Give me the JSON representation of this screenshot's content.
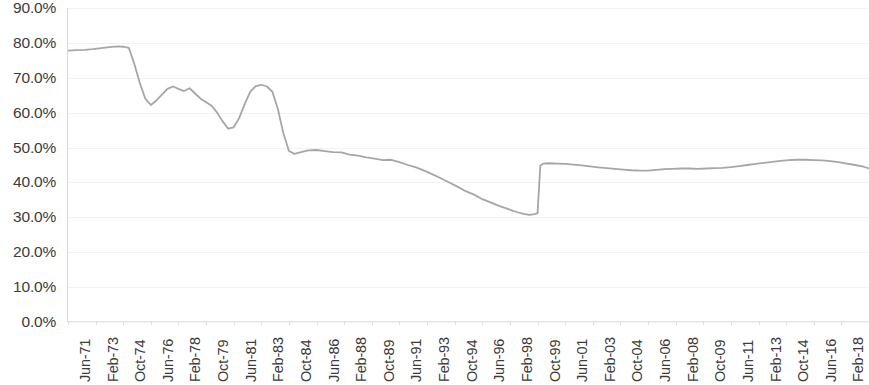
{
  "chart_data": {
    "type": "line",
    "title": "",
    "subtitle": "",
    "xlabel": "",
    "ylabel": "",
    "ylim": [
      0,
      90
    ],
    "ytick_labels": [
      "90.0%",
      "80.0%",
      "70.0%",
      "60.0%",
      "50.0%",
      "40.0%",
      "30.0%",
      "20.0%",
      "10.0%",
      "0.0%"
    ],
    "ytick_values": [
      90,
      80,
      70,
      60,
      50,
      40,
      30,
      20,
      10,
      0
    ],
    "grid": true,
    "legend": "none",
    "line_color": "#a6a6a6",
    "line_width": 1.8,
    "markers": false,
    "xtick_labels": [
      "Jun-71",
      "Feb-73",
      "Oct-74",
      "Jun-76",
      "Feb-78",
      "Oct-79",
      "Jun-81",
      "Feb-83",
      "Oct-84",
      "Jun-86",
      "Feb-88",
      "Oct-89",
      "Jun-91",
      "Feb-93",
      "Oct-94",
      "Jun-96",
      "Feb-98",
      "Oct-99",
      "Jun-01",
      "Feb-03",
      "Oct-04",
      "Jun-06",
      "Feb-08",
      "Oct-09",
      "Jun-11",
      "Feb-13",
      "Oct-14",
      "Jun-16",
      "Feb-18"
    ],
    "xtick_interval_months": 20,
    "x_start": "Jun-71",
    "x_end": "Oct-19",
    "series": [
      {
        "name": "Series 1",
        "x": [
          "Jun-71",
          "Dec-71",
          "Jun-72",
          "Dec-72",
          "Jun-73",
          "Dec-73",
          "Jun-74",
          "Oct-74",
          "Feb-75",
          "Jun-75",
          "Oct-75",
          "Feb-76",
          "Jun-76",
          "Oct-76",
          "Feb-77",
          "Jun-77",
          "Oct-77",
          "Feb-78",
          "Jun-78",
          "Oct-78",
          "Feb-79",
          "Jun-79",
          "Oct-79",
          "Feb-80",
          "Jun-80",
          "Oct-80",
          "Feb-81",
          "Jun-81",
          "Oct-81",
          "Feb-82",
          "Jun-82",
          "Oct-82",
          "Feb-83",
          "Jun-83",
          "Oct-83",
          "Feb-84",
          "Jun-84",
          "Oct-84",
          "Feb-85",
          "Jun-85",
          "Dec-85",
          "Jun-86",
          "Dec-86",
          "Jun-87",
          "Dec-87",
          "Jun-88",
          "Dec-88",
          "Jun-89",
          "Dec-89",
          "Jun-90",
          "Dec-90",
          "Jun-91",
          "Dec-91",
          "Jun-92",
          "Dec-92",
          "Jun-93",
          "Dec-93",
          "Jun-94",
          "Dec-94",
          "Jun-95",
          "Dec-95",
          "Jun-96",
          "Dec-96",
          "Jun-97",
          "Dec-97",
          "Jun-98",
          "Dec-98",
          "Apr-99",
          "Aug-99",
          "Oct-99",
          "Nov-99",
          "Dec-99",
          "Feb-00",
          "Jun-00",
          "Dec-00",
          "Jun-01",
          "Dec-01",
          "Jun-02",
          "Dec-02",
          "Jun-03",
          "Dec-03",
          "Jun-04",
          "Dec-04",
          "Jun-05",
          "Dec-05",
          "Jun-06",
          "Dec-06",
          "Jun-07",
          "Dec-07",
          "Jun-08",
          "Dec-08",
          "Jun-09",
          "Dec-09",
          "Jun-10",
          "Dec-10",
          "Jun-11",
          "Dec-11",
          "Jun-12",
          "Dec-12",
          "Jun-13",
          "Dec-13",
          "Jun-14",
          "Dec-14",
          "Jun-15",
          "Dec-15",
          "Jun-16",
          "Dec-16",
          "Jun-17",
          "Dec-17",
          "Jun-18",
          "Dec-18",
          "Jun-19",
          "Oct-19"
        ],
        "y": [
          77.8,
          77.9,
          78.0,
          78.2,
          78.5,
          78.8,
          79.0,
          78.9,
          78.6,
          74.0,
          68.5,
          64.0,
          62.2,
          63.5,
          65.2,
          66.8,
          67.5,
          66.8,
          66.2,
          67.0,
          65.5,
          64.0,
          63.0,
          62.0,
          60.0,
          57.5,
          55.4,
          55.8,
          58.5,
          62.5,
          66.0,
          67.6,
          68.0,
          67.5,
          66.0,
          61.0,
          54.0,
          49.0,
          48.2,
          48.6,
          49.2,
          49.3,
          49.0,
          48.7,
          48.6,
          48.0,
          47.7,
          47.2,
          46.8,
          46.4,
          46.5,
          45.8,
          45.0,
          44.3,
          43.4,
          42.3,
          41.2,
          40.0,
          38.8,
          37.5,
          36.5,
          35.2,
          34.3,
          33.3,
          32.5,
          31.6,
          31.0,
          30.7,
          30.9,
          31.2,
          38.0,
          44.8,
          45.4,
          45.5,
          45.4,
          45.3,
          45.1,
          44.9,
          44.6,
          44.3,
          44.1,
          43.9,
          43.7,
          43.5,
          43.4,
          43.4,
          43.6,
          43.8,
          43.9,
          44.0,
          44.0,
          43.9,
          44.0,
          44.1,
          44.2,
          44.4,
          44.7,
          45.0,
          45.3,
          45.6,
          45.9,
          46.2,
          46.4,
          46.5,
          46.5,
          46.4,
          46.3,
          46.1,
          45.8,
          45.4,
          45.0,
          44.5,
          44.0
        ]
      }
    ]
  }
}
